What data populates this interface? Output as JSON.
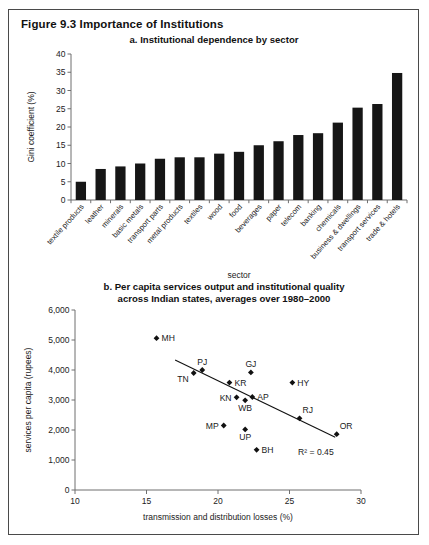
{
  "figure": {
    "title": "Figure 9.3  Importance of Institutions"
  },
  "panel_a": {
    "title": "a. Institutional dependence by sector"
  },
  "panel_b": {
    "title_line1": "b. Per capita services output and institutional quality",
    "title_line2": "across Indian states, averages over 1980–2000"
  },
  "chart_data": [
    {
      "type": "bar",
      "title": "a. Institutional dependence by sector",
      "xlabel": "sector",
      "ylabel": "Gini coefficient (%)",
      "ylim": [
        0,
        40
      ],
      "yticks": [
        0,
        5,
        10,
        15,
        20,
        25,
        30,
        35,
        40
      ],
      "ytick_labels": [
        "0",
        "5",
        "10",
        "15",
        "20",
        "25",
        "30",
        "35",
        "40"
      ],
      "grid": false,
      "legend": "none",
      "categories": [
        "textile products",
        "leather",
        "minerals",
        "basic metals",
        "transport parts",
        "metal products",
        "textiles",
        "wood",
        "food",
        "beverages",
        "paper",
        "telecom",
        "banking",
        "chemicals",
        "business & dwellings",
        "transport services",
        "trade & hotels"
      ],
      "values": [
        5.0,
        8.5,
        9.2,
        10.0,
        11.3,
        11.7,
        11.7,
        12.7,
        13.2,
        15.0,
        16.1,
        17.8,
        18.3,
        21.2,
        25.3,
        26.3,
        34.8
      ],
      "bar_color": "#161616"
    },
    {
      "type": "scatter",
      "title": "b. Per capita services output and institutional quality across Indian states, averages over 1980–2000",
      "xlabel": "transmission and distribution losses (%)",
      "ylabel": "services per capita (rupees)",
      "xlim": [
        10,
        30
      ],
      "ylim": [
        0,
        6000
      ],
      "xticks": [
        10,
        15,
        20,
        25,
        30
      ],
      "xtick_labels": [
        "10",
        "15",
        "20",
        "25",
        "30"
      ],
      "yticks": [
        0,
        1000,
        2000,
        3000,
        4000,
        5000,
        6000
      ],
      "ytick_labels": [
        "0",
        "1,000",
        "2,000",
        "3,000",
        "4,000",
        "5,000",
        "6,000"
      ],
      "grid": false,
      "legend": "none",
      "annotation": "R² = 0.45",
      "points": [
        {
          "label": "MH",
          "x": 15.7,
          "y": 5060,
          "label_pos": "right"
        },
        {
          "label": "PJ",
          "x": 18.9,
          "y": 4000,
          "label_pos": "above"
        },
        {
          "label": "TN",
          "x": 18.3,
          "y": 3900,
          "label_pos": "below-left"
        },
        {
          "label": "GJ",
          "x": 22.3,
          "y": 3920,
          "label_pos": "above"
        },
        {
          "label": "KR",
          "x": 20.8,
          "y": 3580,
          "label_pos": "right"
        },
        {
          "label": "HY",
          "x": 25.2,
          "y": 3580,
          "label_pos": "right"
        },
        {
          "label": "KN",
          "x": 21.3,
          "y": 3090,
          "label_pos": "left"
        },
        {
          "label": "AP",
          "x": 22.4,
          "y": 3100,
          "label_pos": "right"
        },
        {
          "label": "WB",
          "x": 21.9,
          "y": 2990,
          "label_pos": "below"
        },
        {
          "label": "RJ",
          "x": 25.7,
          "y": 2390,
          "label_pos": "above-right"
        },
        {
          "label": "OR",
          "x": 28.3,
          "y": 1860,
          "label_pos": "above-right"
        },
        {
          "label": "MP",
          "x": 20.4,
          "y": 2150,
          "label_pos": "left"
        },
        {
          "label": "UP",
          "x": 21.9,
          "y": 2020,
          "label_pos": "below"
        },
        {
          "label": "BH",
          "x": 22.7,
          "y": 1340,
          "label_pos": "right"
        }
      ],
      "trendline": {
        "x1": 17.0,
        "y1": 4330,
        "x2": 28.2,
        "y2": 1760
      }
    }
  ]
}
